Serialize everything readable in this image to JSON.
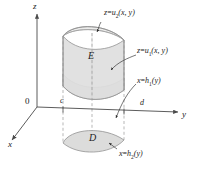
{
  "figure": {
    "name": "triple-integral-type-2-region",
    "axes": {
      "z_label": "z",
      "y_label": "y",
      "x_label": "x",
      "origin_label": "0"
    },
    "ticks": {
      "y_lower": "c",
      "y_upper": "d"
    },
    "regions": {
      "solid_label": "E",
      "projection_label": "D"
    },
    "surfaces": {
      "top": {
        "lhs": "z",
        "rel": "=",
        "fn": "u",
        "sub": "2",
        "args": "(x, y)",
        "full": "z = u2(x, y)"
      },
      "bottom": {
        "lhs": "z",
        "rel": "=",
        "fn": "u",
        "sub": "1",
        "args": "(x, y)",
        "full": "z = u1(x, y)"
      },
      "right_boundary": {
        "lhs": "x",
        "rel": "=",
        "fn": "h",
        "sub": "1",
        "args": "(y)",
        "full": "x = h1(y)"
      },
      "front_boundary": {
        "lhs": "x",
        "rel": "=",
        "fn": "h",
        "sub": "2",
        "args": "(y)",
        "full": "x = h2(y)"
      }
    },
    "colors": {
      "background": "#ffffff",
      "axis": "#4a4a4a",
      "solid_fill": "#dededd",
      "solid_top_fill": "#e9e9e8",
      "solid_edge": "#8e8e8e",
      "projection_fill": "#dcdcdb",
      "dashed": "#9a9a9a",
      "text": "#1a1a1a"
    }
  }
}
